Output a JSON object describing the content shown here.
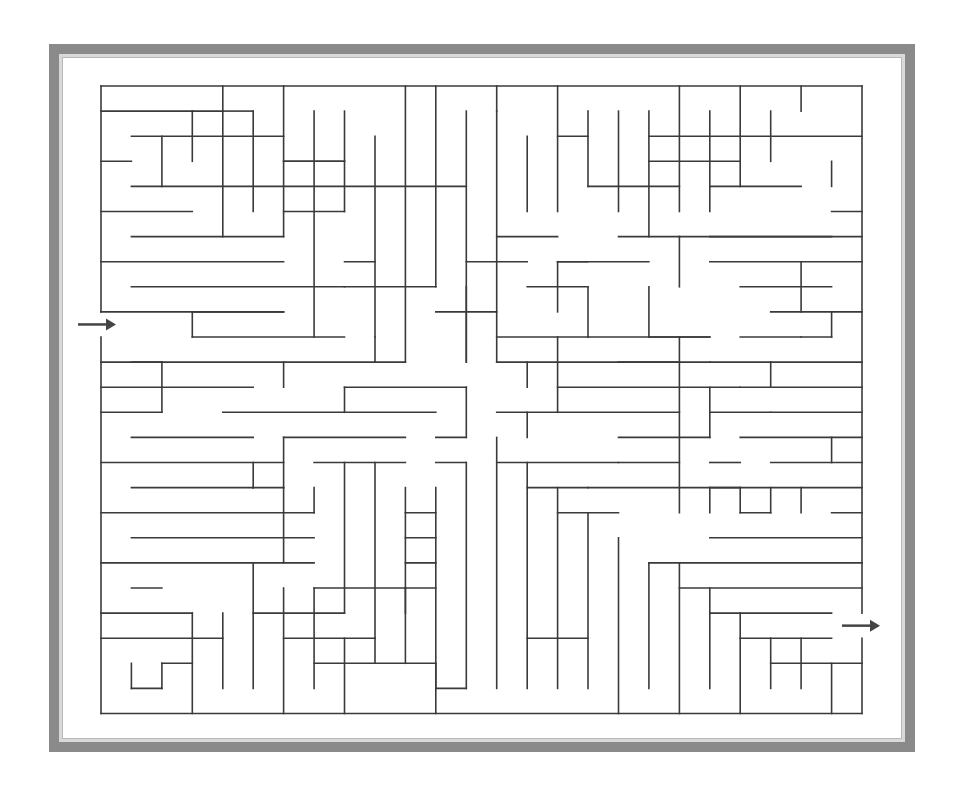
{
  "puzzle": {
    "title": "Maze",
    "type": "maze",
    "colors": {
      "frame": "#8a8a8a",
      "stripe": "#d9d9d9",
      "wall": "#3a3a3a",
      "arrow": "#444444",
      "background": "#ffffff"
    },
    "grid": {
      "x0": 101,
      "y0": 86,
      "cell_w": 30.44,
      "cell_h": 25.1,
      "cols": 25,
      "rows": 25
    },
    "entrance": {
      "side": "left",
      "row": 9,
      "label": "start-arrow"
    },
    "exit": {
      "side": "right",
      "row": 21,
      "label": "end-arrow"
    },
    "walls_h": [
      [
        0,
        0,
        25
      ],
      [
        0,
        1,
        3
      ],
      [
        3,
        1,
        4
      ],
      [
        4,
        1,
        5
      ],
      [
        1,
        2,
        6
      ],
      [
        15,
        2,
        16
      ],
      [
        21,
        2,
        25
      ],
      [
        18,
        2,
        21
      ],
      [
        0,
        3,
        1
      ],
      [
        6,
        3,
        8
      ],
      [
        18,
        3,
        21
      ],
      [
        6,
        3,
        8
      ],
      [
        1,
        4,
        12
      ],
      [
        20,
        4,
        23
      ],
      [
        16,
        4,
        19
      ],
      [
        0,
        5,
        3
      ],
      [
        6,
        5,
        8
      ],
      [
        24,
        5,
        25
      ],
      [
        1,
        6,
        6
      ],
      [
        13,
        6,
        15
      ],
      [
        17,
        6,
        19
      ],
      [
        19,
        6,
        25
      ],
      [
        20,
        6,
        24
      ],
      [
        0,
        7,
        6
      ],
      [
        8,
        7,
        9
      ],
      [
        12,
        7,
        14
      ],
      [
        15,
        7,
        16
      ],
      [
        20,
        7,
        25
      ],
      [
        15,
        7,
        18
      ],
      [
        1,
        8,
        8
      ],
      [
        8,
        8,
        11
      ],
      [
        14,
        8,
        16
      ],
      [
        21,
        8,
        24
      ],
      [
        0,
        9,
        6
      ],
      [
        3,
        9,
        6
      ],
      [
        11,
        9,
        13
      ],
      [
        22,
        9,
        25
      ],
      [
        3,
        10,
        8
      ],
      [
        13,
        10,
        16
      ],
      [
        16,
        10,
        20
      ],
      [
        18,
        10,
        20
      ],
      [
        21,
        10,
        23
      ],
      [
        23,
        10,
        24
      ],
      [
        0,
        11,
        2
      ],
      [
        1,
        11,
        9
      ],
      [
        9,
        11,
        10
      ],
      [
        13,
        11,
        19
      ],
      [
        17,
        11,
        20
      ],
      [
        20,
        11,
        25
      ],
      [
        0,
        12,
        5
      ],
      [
        8,
        12,
        12
      ],
      [
        15,
        12,
        21
      ],
      [
        21,
        12,
        25
      ],
      [
        0,
        13,
        2
      ],
      [
        4,
        13,
        11
      ],
      [
        13,
        13,
        15
      ],
      [
        15,
        13,
        19
      ],
      [
        20,
        13,
        22
      ],
      [
        22,
        13,
        25
      ],
      [
        1,
        14,
        5
      ],
      [
        6,
        14,
        10
      ],
      [
        11,
        14,
        12
      ],
      [
        17,
        14,
        20
      ],
      [
        21,
        14,
        25
      ],
      [
        0,
        15,
        6
      ],
      [
        7,
        15,
        10
      ],
      [
        11,
        15,
        12
      ],
      [
        13,
        15,
        17
      ],
      [
        17,
        15,
        19
      ],
      [
        20,
        15,
        21
      ],
      [
        22,
        15,
        25
      ],
      [
        1,
        16,
        5
      ],
      [
        5,
        16,
        6
      ],
      [
        14,
        16,
        16
      ],
      [
        16,
        16,
        21
      ],
      [
        20,
        16,
        25
      ],
      [
        0,
        17,
        7
      ],
      [
        10,
        17,
        11
      ],
      [
        15,
        17,
        17
      ],
      [
        21,
        17,
        22
      ],
      [
        24,
        17,
        25
      ],
      [
        1,
        18,
        7
      ],
      [
        10,
        18,
        11
      ],
      [
        20,
        18,
        25
      ],
      [
        0,
        19,
        7
      ],
      [
        10,
        19,
        11
      ],
      [
        18,
        19,
        25
      ],
      [
        1,
        20,
        2
      ],
      [
        7,
        20,
        10
      ],
      [
        10,
        20,
        11
      ],
      [
        19,
        20,
        25
      ],
      [
        0,
        21,
        3
      ],
      [
        5,
        21,
        8
      ],
      [
        20,
        21,
        24
      ],
      [
        0,
        22,
        4
      ],
      [
        6,
        22,
        9
      ],
      [
        14,
        22,
        16
      ],
      [
        21,
        22,
        24
      ],
      [
        2,
        23,
        3
      ],
      [
        7,
        23,
        11
      ],
      [
        22,
        23,
        25
      ],
      [
        1,
        24,
        2
      ],
      [
        11,
        24,
        12
      ],
      [
        0,
        25,
        25
      ]
    ],
    "walls_v": [
      [
        0,
        0,
        9
      ],
      [
        0,
        10,
        25
      ],
      [
        25,
        0,
        21
      ],
      [
        25,
        22,
        25
      ],
      [
        2,
        2,
        4
      ],
      [
        3,
        1,
        3
      ],
      [
        4,
        0,
        6
      ],
      [
        5,
        1,
        5
      ],
      [
        6,
        0,
        6
      ],
      [
        7,
        1,
        10
      ],
      [
        8,
        1,
        5
      ],
      [
        9,
        2,
        10
      ],
      [
        10,
        0,
        11
      ],
      [
        11,
        0,
        8
      ],
      [
        12,
        1,
        11
      ],
      [
        13,
        1,
        11
      ],
      [
        13,
        0,
        1
      ],
      [
        14,
        2,
        5
      ],
      [
        15,
        0,
        5
      ],
      [
        16,
        1,
        4
      ],
      [
        17,
        1,
        5
      ],
      [
        18,
        1,
        6
      ],
      [
        19,
        0,
        5
      ],
      [
        20,
        1,
        5
      ],
      [
        21,
        0,
        4
      ],
      [
        23,
        0,
        1
      ],
      [
        22,
        1,
        3
      ],
      [
        24,
        3,
        4
      ],
      [
        3,
        9,
        10
      ],
      [
        2,
        11,
        13
      ],
      [
        6,
        11,
        12
      ],
      [
        9,
        10,
        11
      ],
      [
        8,
        12,
        13
      ],
      [
        12,
        12,
        14
      ],
      [
        14,
        13,
        14
      ],
      [
        15,
        10,
        13
      ],
      [
        19,
        10,
        17
      ],
      [
        20,
        12,
        14
      ],
      [
        22,
        11,
        12
      ],
      [
        24,
        9,
        10
      ],
      [
        23,
        7,
        9
      ],
      [
        19,
        6,
        8
      ],
      [
        14,
        11,
        12
      ],
      [
        16,
        8,
        10
      ],
      [
        15,
        7,
        9
      ],
      [
        18,
        8,
        10
      ],
      [
        12,
        8,
        11
      ],
      [
        6,
        14,
        16
      ],
      [
        5,
        15,
        16
      ],
      [
        6,
        16,
        19
      ],
      [
        7,
        16,
        17
      ],
      [
        9,
        15,
        22
      ],
      [
        10,
        16,
        21
      ],
      [
        11,
        16,
        24
      ],
      [
        8,
        15,
        21
      ],
      [
        9,
        22,
        23
      ],
      [
        12,
        15,
        24
      ],
      [
        13,
        14,
        24
      ],
      [
        14,
        15,
        24
      ],
      [
        15,
        16,
        24
      ],
      [
        16,
        17,
        24
      ],
      [
        17,
        18,
        25
      ],
      [
        18,
        19,
        24
      ],
      [
        19,
        19,
        25
      ],
      [
        20,
        20,
        24
      ],
      [
        21,
        21,
        25
      ],
      [
        22,
        22,
        24
      ],
      [
        23,
        22,
        24
      ],
      [
        24,
        23,
        25
      ],
      [
        3,
        21,
        25
      ],
      [
        4,
        21,
        24
      ],
      [
        5,
        19,
        24
      ],
      [
        2,
        23,
        24
      ],
      [
        1,
        23,
        24
      ],
      [
        6,
        20,
        25
      ],
      [
        7,
        20,
        24
      ],
      [
        8,
        22,
        25
      ],
      [
        10,
        20,
        23
      ],
      [
        11,
        23,
        25
      ],
      [
        20,
        16,
        17
      ],
      [
        21,
        16,
        17
      ],
      [
        22,
        16,
        17
      ],
      [
        23,
        16,
        17
      ],
      [
        24,
        14,
        15
      ]
    ]
  }
}
